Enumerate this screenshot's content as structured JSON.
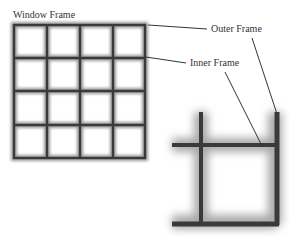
{
  "labels": {
    "window_frame": "Window Frame",
    "outer_frame": "Outer Frame",
    "inner_frame": "Inner Frame"
  },
  "grid": {
    "rows": 4,
    "cols": 4
  },
  "colors": {
    "frame": "#3a3a3a",
    "pane": "#ffffff",
    "glow": "#bdbdbd",
    "arrow": "#333333"
  }
}
